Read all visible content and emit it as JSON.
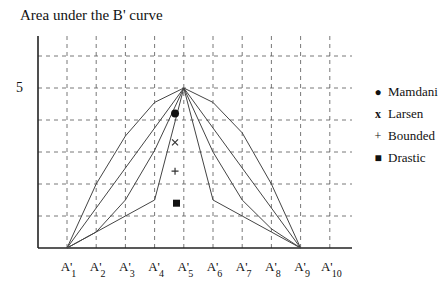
{
  "chart_data": {
    "type": "line",
    "title": "Area under the B' curve",
    "xlabel": "",
    "ylabel": "",
    "categories": [
      "A'1",
      "A'2",
      "A'3",
      "A'4",
      "A'5",
      "A'6",
      "A'7",
      "A'8",
      "A'9",
      "A'10"
    ],
    "x_ticks": [
      {
        "base": "A'",
        "sub": "1"
      },
      {
        "base": "A'",
        "sub": "2"
      },
      {
        "base": "A'",
        "sub": "3"
      },
      {
        "base": "A'",
        "sub": "4"
      },
      {
        "base": "A'",
        "sub": "5"
      },
      {
        "base": "A'",
        "sub": "6"
      },
      {
        "base": "A'",
        "sub": "7"
      },
      {
        "base": "A'",
        "sub": "8"
      },
      {
        "base": "A'",
        "sub": "9"
      },
      {
        "base": "A'",
        "sub": "10"
      }
    ],
    "y_tick_labels": [
      {
        "value": 5,
        "label": "5"
      }
    ],
    "ylim": [
      0,
      6.5
    ],
    "grid": true,
    "legend_position": "right",
    "series": [
      {
        "name": "Mamdani",
        "marker": "circle",
        "values": [
          0,
          2.0,
          3.5,
          4.55,
          5,
          4.55,
          3.6,
          2.0,
          0,
          null
        ],
        "marker_at": [
          3.7,
          4.2
        ]
      },
      {
        "name": "Larsen",
        "marker": "x",
        "values": [
          0,
          1.25,
          2.5,
          3.75,
          5,
          3.75,
          2.5,
          1.25,
          0,
          null
        ],
        "marker_at": [
          3.7,
          3.3
        ]
      },
      {
        "name": "Bounded",
        "marker": "plus",
        "values": [
          0,
          0.5,
          1.5,
          3.05,
          5,
          3.0,
          1.5,
          0.6,
          0,
          null
        ],
        "marker_at": [
          3.7,
          2.4
        ]
      },
      {
        "name": "Drastic",
        "marker": "square",
        "values": [
          0,
          0.5,
          1.0,
          1.5,
          5,
          1.5,
          1.0,
          0.5,
          0,
          null
        ],
        "marker_at": [
          3.75,
          1.4
        ]
      }
    ]
  },
  "title": "Area under the B' curve",
  "y_label_5": "5",
  "legend": [
    {
      "symbol": "●",
      "label": "Mamdani"
    },
    {
      "symbol": "x",
      "label": "Larsen"
    },
    {
      "symbol": "+",
      "label": "Bounded"
    },
    {
      "symbol": "■",
      "label": "Drastic"
    }
  ]
}
